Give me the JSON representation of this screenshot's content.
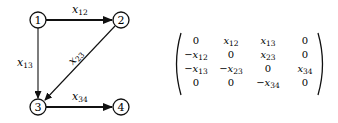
{
  "graph": {
    "nodes": [
      {
        "id": "1",
        "label": "1",
        "x": 38,
        "y": 20
      },
      {
        "id": "2",
        "label": "2",
        "x": 121,
        "y": 20
      },
      {
        "id": "3",
        "label": "3",
        "x": 38,
        "y": 107
      },
      {
        "id": "4",
        "label": "4",
        "x": 121,
        "y": 107
      }
    ],
    "edges": [
      {
        "from": "1",
        "to": "2",
        "var": "x",
        "sub": "12",
        "style": "bold"
      },
      {
        "from": "1",
        "to": "3",
        "var": "x",
        "sub": "13",
        "style": "thin"
      },
      {
        "from": "2",
        "to": "3",
        "var": "x",
        "sub": "23",
        "style": "thin"
      },
      {
        "from": "3",
        "to": "4",
        "var": "x",
        "sub": "34",
        "style": "bold"
      }
    ]
  },
  "matrix": {
    "rows": [
      [
        {
          "sign": "",
          "var": "",
          "sub": "",
          "text": "0"
        },
        {
          "sign": "",
          "var": "x",
          "sub": "12",
          "text": ""
        },
        {
          "sign": "",
          "var": "x",
          "sub": "13",
          "text": ""
        },
        {
          "sign": "",
          "var": "",
          "sub": "",
          "text": "0"
        }
      ],
      [
        {
          "sign": "−",
          "var": "x",
          "sub": "12",
          "text": ""
        },
        {
          "sign": "",
          "var": "",
          "sub": "",
          "text": "0"
        },
        {
          "sign": "",
          "var": "x",
          "sub": "23",
          "text": ""
        },
        {
          "sign": "",
          "var": "",
          "sub": "",
          "text": "0"
        }
      ],
      [
        {
          "sign": "−",
          "var": "x",
          "sub": "13",
          "text": ""
        },
        {
          "sign": "−",
          "var": "x",
          "sub": "23",
          "text": ""
        },
        {
          "sign": "",
          "var": "",
          "sub": "",
          "text": "0"
        },
        {
          "sign": "",
          "var": "x",
          "sub": "34",
          "text": ""
        }
      ],
      [
        {
          "sign": "",
          "var": "",
          "sub": "",
          "text": "0"
        },
        {
          "sign": "",
          "var": "",
          "sub": "",
          "text": "0"
        },
        {
          "sign": "−",
          "var": "x",
          "sub": "34",
          "text": ""
        },
        {
          "sign": "",
          "var": "",
          "sub": "",
          "text": "0"
        }
      ]
    ]
  },
  "labels": {
    "n1": "1",
    "n2": "2",
    "n3": "3",
    "n4": "4",
    "e12_var": "x",
    "e12_sub": "12",
    "e13_var": "x",
    "e13_sub": "13",
    "e23_var": "x",
    "e23_sub": "23",
    "e34_var": "x",
    "e34_sub": "34",
    "m": {
      "r0c0": "0",
      "r0c1v": "x",
      "r0c1s": "12",
      "r0c2v": "x",
      "r0c2s": "13",
      "r0c3": "0",
      "r1c0v": "−x",
      "r1c0s": "12",
      "r1c1": "0",
      "r1c2v": "x",
      "r1c2s": "23",
      "r1c3": "0",
      "r2c0v": "−x",
      "r2c0s": "13",
      "r2c1v": "−x",
      "r2c1s": "23",
      "r2c2": "0",
      "r2c3v": "x",
      "r2c3s": "34",
      "r3c0": "0",
      "r3c1": "0",
      "r3c2v": "−x",
      "r3c2s": "34",
      "r3c3": "0"
    }
  }
}
